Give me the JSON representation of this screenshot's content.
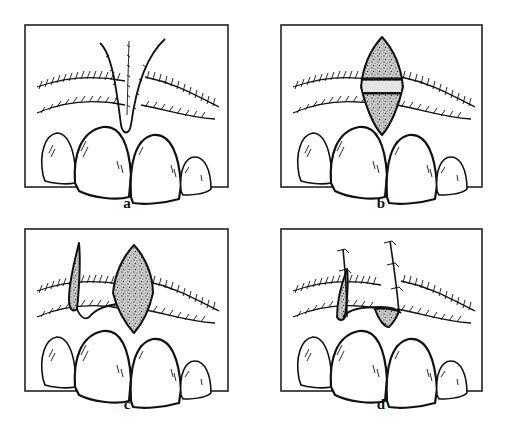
{
  "figure": {
    "panels": [
      {
        "id": "a",
        "label": "a",
        "description": "V-shaped incision between central incisors"
      },
      {
        "id": "b",
        "label": "b",
        "description": "Diamond-shaped stippled graft with a horizontal band placed above midline"
      },
      {
        "id": "c",
        "label": "c",
        "description": "Diamond-shaped graft plus narrow lateral strip graft"
      },
      {
        "id": "d",
        "label": "d",
        "description": "Grafts sutured in place with interrupted sutures"
      }
    ]
  },
  "colors": {
    "ink": "#111111",
    "background": "#ffffff",
    "frame": "#222222"
  }
}
